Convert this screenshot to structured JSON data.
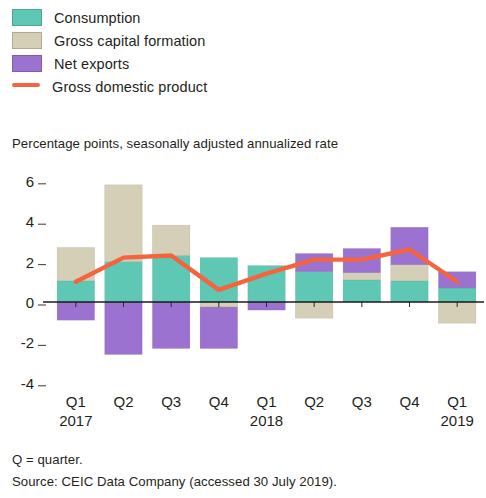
{
  "legend": {
    "items": [
      {
        "label": "Consumption",
        "color": "#5ec8b4",
        "type": "swatch",
        "icon": "square-swatch-icon"
      },
      {
        "label": "Gross capital formation",
        "color": "#d6cfb7",
        "type": "swatch",
        "icon": "square-swatch-icon"
      },
      {
        "label": "Net exports",
        "color": "#9b72d0",
        "type": "swatch",
        "icon": "square-swatch-icon"
      },
      {
        "label": "Gross domestic product",
        "color": "#f4653f",
        "type": "line",
        "icon": "line-swatch-icon"
      }
    ]
  },
  "notes": [
    "Q = quarter.",
    "Source: CEIC Data Company (accessed 30 July 2019)."
  ],
  "chart_data": {
    "type": "bar",
    "title": "",
    "subtitle": "Percentage points, seasonally adjusted annualized rate",
    "xlabel": "",
    "ylabel": "Percentage points, seasonally adjusted annualized rate",
    "ylim": [
      -4,
      6
    ],
    "yticks": [
      6,
      4,
      2,
      0,
      -2,
      -4
    ],
    "ytick_labels": [
      "6",
      "4",
      "2",
      "0",
      "-2",
      "-4"
    ],
    "grid": false,
    "stacked": true,
    "legend_position": "top-left",
    "categories": [
      "Q1",
      "Q2",
      "Q3",
      "Q4",
      "Q1",
      "Q2",
      "Q3",
      "Q4",
      "Q1"
    ],
    "year_labels": [
      {
        "index": 0,
        "label": "2017"
      },
      {
        "index": 4,
        "label": "2018"
      },
      {
        "index": 8,
        "label": "2019"
      }
    ],
    "series": [
      {
        "name": "Consumption",
        "color": "#5ec8b4",
        "values": [
          1.05,
          2.0,
          2.3,
          2.2,
          1.8,
          1.5,
          1.1,
          1.05,
          0.7
        ]
      },
      {
        "name": "Gross capital formation",
        "color": "#d6cfb7",
        "values": [
          1.65,
          3.8,
          1.5,
          -0.25,
          0.0,
          -0.8,
          0.35,
          0.8,
          -1.05
        ]
      },
      {
        "name": "Net exports",
        "color": "#9b72d0",
        "values": [
          -0.9,
          -2.6,
          -2.3,
          -2.05,
          -0.4,
          0.9,
          1.2,
          1.85,
          0.8
        ]
      }
    ],
    "line_series": {
      "name": "Gross domestic product",
      "color": "#f4653f",
      "values": [
        1.0,
        2.2,
        2.3,
        0.6,
        1.4,
        2.1,
        2.1,
        2.6,
        1.0
      ]
    }
  }
}
